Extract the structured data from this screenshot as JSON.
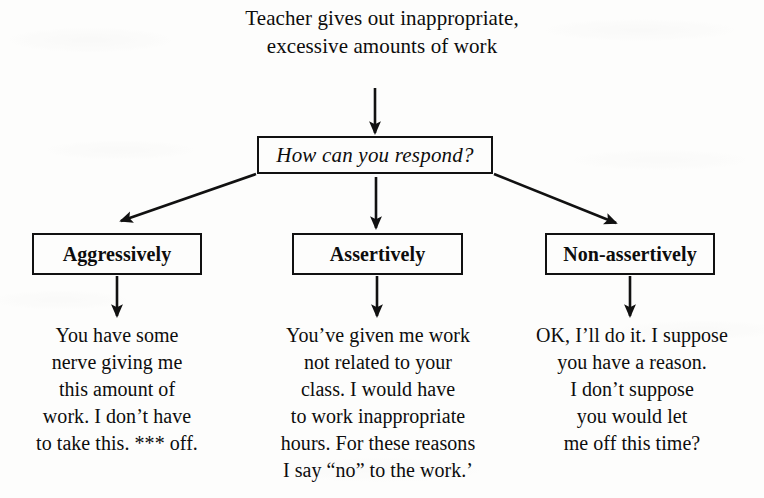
{
  "diagram": {
    "stem": {
      "lines": [
        "Teacher gives out",
        "inappropriate, excessive",
        "amounts of work"
      ],
      "text": "Teacher gives out inappropriate, excessive amounts of work"
    },
    "question": {
      "label": "How can you respond?"
    },
    "branches": [
      {
        "id": "aggressive",
        "label": "Aggressively",
        "response_lines": [
          "You have some",
          "nerve giving me",
          "this amount of",
          "work. I don’t have",
          "to take this. *** off."
        ],
        "response_text": "You have some nerve giving me this amount of work. I don’t have to take this. *** off."
      },
      {
        "id": "assertive",
        "label": "Assertively",
        "response_lines": [
          "You’ve given me work",
          "not related to your",
          "class. I would have",
          "to work inappropriate",
          "hours. For these reasons",
          "I say “no” to the work.’"
        ],
        "response_text": "You’ve given me work not related to your class. I would have to work inappropriate hours. For these reasons I say “no” to the work.’"
      },
      {
        "id": "nonassertive",
        "label": "Non-assertively",
        "response_lines": [
          "OK, I’ll do it. I suppose",
          "you have a reason.",
          "I don’t suppose",
          "you would let",
          "me off this time?"
        ],
        "response_text": "OK, I’ll do it. I suppose you have a reason. I don’t suppose you would let me off this time?"
      }
    ],
    "colors": {
      "ink": "#111111",
      "paper": "#fdfdfc"
    }
  }
}
